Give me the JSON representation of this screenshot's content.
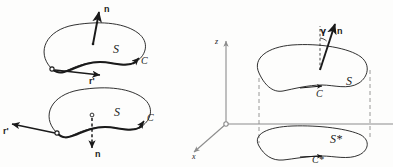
{
  "figure": {
    "kind": "vector-calculus-orientation-diagram",
    "ink_color": "#1a1a1a",
    "axis_color": "#8c8c8c",
    "dash_color": "#8c8c8c",
    "background": "#fdfdfc"
  },
  "panel_upper_left": {
    "name": "surface-with-upward-normal",
    "normal_label": "n",
    "surface_label": "S",
    "curve_label": "C",
    "tangent_label": "r'",
    "normal_direction": "up",
    "traversal": "counterclockwise"
  },
  "panel_lower_left": {
    "name": "surface-with-downward-normal",
    "normal_label": "n",
    "surface_label": "S",
    "curve_label": "C",
    "tangent_label": "r'",
    "normal_direction": "down",
    "traversal": "clockwise"
  },
  "panel_right": {
    "name": "surface-projected-onto-xy-plane",
    "axis_z_label": "z",
    "axis_x_label": "x",
    "normal_label": "n",
    "angle_label": "γ",
    "surface_label": "S",
    "curve_label": "C",
    "projected_surface_label": "S*",
    "projected_curve_label": "C*"
  }
}
